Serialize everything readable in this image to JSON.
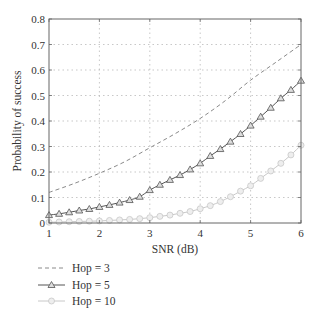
{
  "chart_data": {
    "type": "line",
    "title": "",
    "xlabel": "SNR (dB)",
    "ylabel": "Probability of success",
    "xlim": [
      1,
      6
    ],
    "ylim": [
      0,
      0.8
    ],
    "xticks": [
      1,
      2,
      3,
      4,
      5,
      6
    ],
    "xtick_labels": [
      "1",
      "2",
      "3",
      "4",
      "5",
      "6"
    ],
    "yticks": [
      0,
      0.1,
      0.2,
      0.3,
      0.4,
      0.5,
      0.6,
      0.7,
      0.8
    ],
    "ytick_labels": [
      "0",
      "0.1",
      "0.2",
      "0.3",
      "0.4",
      "0.5",
      "0.6",
      "0.7",
      "0.8"
    ],
    "grid": true,
    "legend_position": "below-left",
    "series": [
      {
        "name": "Hop = 3",
        "style": "dashed",
        "marker": "none",
        "color": "#8a8a8a",
        "x": [
          1.0,
          1.5,
          2.0,
          2.5,
          3.0,
          3.5,
          4.0,
          4.5,
          5.0,
          5.5,
          6.0
        ],
        "values": [
          0.12,
          0.155,
          0.195,
          0.24,
          0.295,
          0.35,
          0.41,
          0.48,
          0.56,
          0.63,
          0.7
        ]
      },
      {
        "name": "Hop = 5",
        "style": "solid",
        "marker": "triangle",
        "color": "#555555",
        "x": [
          1.0,
          1.2,
          1.4,
          1.6,
          1.8,
          2.0,
          2.2,
          2.4,
          2.6,
          2.8,
          3.0,
          3.2,
          3.4,
          3.6,
          3.8,
          4.0,
          4.2,
          4.4,
          4.6,
          4.8,
          5.0,
          5.2,
          5.4,
          5.6,
          5.8,
          6.0
        ],
        "values": [
          0.031,
          0.036,
          0.042,
          0.049,
          0.055,
          0.063,
          0.071,
          0.08,
          0.09,
          0.103,
          0.129,
          0.15,
          0.169,
          0.188,
          0.21,
          0.234,
          0.263,
          0.29,
          0.319,
          0.349,
          0.382,
          0.417,
          0.452,
          0.489,
          0.522,
          0.558
        ]
      },
      {
        "name": "Hop = 10",
        "style": "solid",
        "marker": "circle",
        "color": "#c8c8c8",
        "x": [
          1.0,
          1.2,
          1.4,
          1.6,
          1.8,
          2.0,
          2.2,
          2.4,
          2.6,
          2.8,
          3.0,
          3.2,
          3.4,
          3.6,
          3.8,
          4.0,
          4.2,
          4.4,
          4.6,
          4.8,
          5.0,
          5.2,
          5.4,
          5.6,
          5.8,
          6.0
        ],
        "values": [
          0.003,
          0.004,
          0.005,
          0.006,
          0.007,
          0.008,
          0.01,
          0.012,
          0.014,
          0.017,
          0.021,
          0.026,
          0.031,
          0.038,
          0.045,
          0.056,
          0.068,
          0.084,
          0.103,
          0.125,
          0.146,
          0.175,
          0.204,
          0.234,
          0.267,
          0.305
        ]
      }
    ]
  },
  "legend": {
    "items": [
      {
        "label": "Hop = 3"
      },
      {
        "label": "Hop = 5"
      },
      {
        "label": "Hop = 10"
      }
    ]
  },
  "colors": {
    "axis": "#555555",
    "grid": "#b0b0b0",
    "hop3": "#8a8a8a",
    "hop5": "#555555",
    "hop10": "#c8c8c8"
  }
}
